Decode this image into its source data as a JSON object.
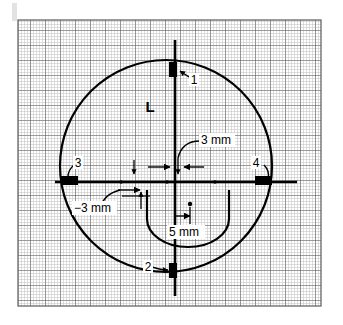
{
  "figure": {
    "background_color": "#ffffff",
    "line_color": "#000000",
    "grid": {
      "minor_color": "#b9b9b9",
      "major_color": "#5a5a5a",
      "minor_spacing_px": 3,
      "major_every": 5,
      "area": {
        "x": 18,
        "y": 20,
        "width": 303,
        "height": 286
      }
    },
    "corner_artifact": {
      "color": "#d8d8d8",
      "x": 12,
      "y": 3,
      "width": 5,
      "height": 18
    }
  },
  "geometry": {
    "outer_circle": {
      "cx": 166,
      "cy": 166,
      "r": 106
    },
    "vertical_axis": {
      "x": 175,
      "y_top": 40,
      "y_bottom": 296
    },
    "horizontal_axis": {
      "y": 182,
      "x_left": 55,
      "x_right": 297
    },
    "inner_u_shape": {
      "left": 147,
      "right": 229,
      "top": 190,
      "bottom": 247
    },
    "center_dot": {
      "cx": 190,
      "cy": 204,
      "r": 2
    },
    "axis_dots": [
      {
        "cx": 121,
        "cy": 182,
        "r": 1.8
      },
      {
        "cx": 167,
        "cy": 182,
        "r": 1.8
      },
      {
        "cx": 215,
        "cy": 182,
        "r": 1.8
      }
    ]
  },
  "markers": [
    {
      "id": "1",
      "label": "1",
      "position": "top",
      "x": 169,
      "y": 62,
      "width": 8,
      "height": 15,
      "label_x": 194,
      "label_y": 81
    },
    {
      "id": "2",
      "label": "2",
      "position": "bottom",
      "x": 169,
      "y": 263,
      "width": 8,
      "height": 15,
      "label_x": 149,
      "label_y": 269
    },
    {
      "id": "3",
      "label": "3",
      "position": "left",
      "x": 61,
      "y": 176,
      "width": 17,
      "height": 9,
      "label_x": 76,
      "label_y": 166
    },
    {
      "id": "4",
      "label": "4",
      "position": "right",
      "x": 255,
      "y": 176,
      "width": 17,
      "height": 9,
      "label_x": 253,
      "label_y": 166
    }
  ],
  "annotations": {
    "region_label": {
      "text": "L",
      "x": 150,
      "y": 108
    },
    "dim_top_right": {
      "text": "3 mm",
      "x": 203,
      "y": 145
    },
    "dim_left": {
      "text": "−3 mm",
      "x": 76,
      "y": 212
    },
    "dim_inner": {
      "text": "5 mm",
      "x": 170,
      "y": 236
    }
  },
  "measurements": [
    {
      "name": "offset-top-right",
      "value": "3 mm"
    },
    {
      "name": "offset-left",
      "value": "−3 mm"
    },
    {
      "name": "inner-offset",
      "value": "5 mm"
    }
  ]
}
